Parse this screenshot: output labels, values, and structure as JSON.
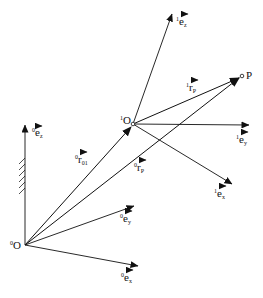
{
  "diagram": {
    "colors": {
      "line": "#111111",
      "background": "#ffffff"
    },
    "points": {
      "O0": {
        "label": "O",
        "sup": "0",
        "x": 25,
        "y": 245
      },
      "O1": {
        "label": "O",
        "sup": "1",
        "x": 133,
        "y": 124
      },
      "P": {
        "label": "P",
        "x": 242,
        "y": 76
      }
    },
    "frame0_axes": [
      {
        "name": "e",
        "sup": "0",
        "sub": "z",
        "tip": [
          25,
          125
        ]
      },
      {
        "name": "e",
        "sup": "0",
        "sub": "y",
        "tip": [
          134,
          206
        ]
      },
      {
        "name": "e",
        "sup": "0",
        "sub": "x",
        "tip": [
          138,
          266
        ]
      }
    ],
    "frame1_axes": [
      {
        "name": "e",
        "sup": "1",
        "sub": "z",
        "tip": [
          172,
          14
        ]
      },
      {
        "name": "e",
        "sup": "1",
        "sub": "y",
        "tip": [
          249,
          125
        ]
      },
      {
        "name": "e",
        "sup": "1",
        "sub": "x",
        "tip": [
          232,
          184
        ]
      }
    ],
    "vectors": [
      {
        "name": "r",
        "sup": "0",
        "sub": "01",
        "from": "O0",
        "to": "O1"
      },
      {
        "name": "r",
        "sup": "0",
        "sub": "P",
        "from": "O0",
        "to": "P"
      },
      {
        "name": "r",
        "sup": "1",
        "sub": "P",
        "from": "O1",
        "to": "P"
      }
    ],
    "labels": {
      "O0": {
        "sup": "0",
        "text": "O"
      },
      "O1": {
        "sup": "1",
        "text": "O"
      },
      "P": "P",
      "e0z": {
        "sup": "0",
        "base": "e",
        "sub": "z"
      },
      "e0y": {
        "sup": "0",
        "base": "e",
        "sub": "y"
      },
      "e0x": {
        "sup": "0",
        "base": "e",
        "sub": "x"
      },
      "e1z": {
        "sup": "1",
        "base": "e",
        "sub": "z"
      },
      "e1y": {
        "sup": "1",
        "base": "e",
        "sub": "y"
      },
      "e1x": {
        "sup": "1",
        "base": "e",
        "sub": "x"
      },
      "r01": {
        "sup": "0",
        "base": "r",
        "sub": "01"
      },
      "r0P": {
        "sup": "0",
        "base": "r",
        "sub": "P"
      },
      "r1P": {
        "sup": "1",
        "base": "r",
        "sub": "P"
      }
    },
    "ground_hatch": {
      "x": 25,
      "y_start": 158,
      "y_end": 192,
      "count": 6
    }
  }
}
